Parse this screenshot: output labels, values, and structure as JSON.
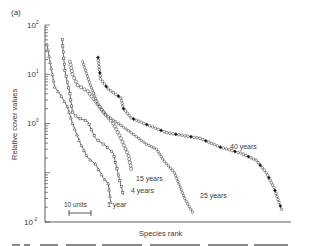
{
  "panel_label": "(a)",
  "chart_data": {
    "type": "line",
    "title": "",
    "xlabel": "Species rank",
    "ylabel": "Relative cover values",
    "yscale": "log",
    "ylim": [
      0.01,
      100
    ],
    "y_ticks": [
      {
        "label_base": "10",
        "label_exp": "2",
        "value": 100
      },
      {
        "label_base": "10",
        "label_exp": "1",
        "value": 10
      },
      {
        "label_base": "10",
        "label_exp": "0",
        "value": 1
      },
      {
        "label_base": "10",
        "label_exp": "-2",
        "value": 0.01
      }
    ],
    "scale_bar": {
      "label": "10 units",
      "length_units": 10
    },
    "grid": false,
    "legend": "inline labels at curve ends",
    "series": [
      {
        "name": "1 year",
        "marker": "triangle",
        "points": [
          [
            0,
            40
          ],
          [
            1,
            20
          ],
          [
            3,
            5.5
          ],
          [
            5,
            4
          ],
          [
            8,
            2.2
          ],
          [
            10,
            1.0
          ],
          [
            13,
            0.4
          ],
          [
            16,
            0.2
          ],
          [
            19,
            0.15
          ],
          [
            22,
            0.08
          ],
          [
            24,
            0.06
          ],
          [
            25,
            0.025
          ]
        ]
      },
      {
        "name": "4 years",
        "marker": "square",
        "points": [
          [
            6,
            50
          ],
          [
            7,
            12
          ],
          [
            9,
            4
          ],
          [
            10,
            1.7
          ],
          [
            12,
            1.3
          ],
          [
            16,
            1.1
          ],
          [
            19,
            0.5
          ],
          [
            23,
            0.35
          ],
          [
            26,
            0.25
          ],
          [
            28,
            0.09
          ],
          [
            30,
            0.035
          ]
        ]
      },
      {
        "name": "15 years",
        "marker": "circle-large",
        "points": [
          [
            9,
            18
          ],
          [
            10,
            10
          ],
          [
            12,
            6
          ],
          [
            16,
            4.5
          ],
          [
            19,
            2.8
          ],
          [
            23,
            1.5
          ],
          [
            26,
            1.0
          ],
          [
            29,
            0.5
          ],
          [
            32,
            0.22
          ],
          [
            33,
            0.12
          ]
        ]
      },
      {
        "name": "25 years",
        "marker": "circle-small",
        "points": [
          [
            14,
            18
          ],
          [
            17,
            6
          ],
          [
            20,
            2.5
          ],
          [
            23,
            1.5
          ],
          [
            28,
            1.0
          ],
          [
            33,
            0.65
          ],
          [
            39,
            0.38
          ],
          [
            43,
            0.3
          ],
          [
            46,
            0.17
          ],
          [
            50,
            0.1
          ],
          [
            54,
            0.03
          ],
          [
            57,
            0.016
          ]
        ]
      },
      {
        "name": "40 years",
        "marker": "circle-and-filled-diamond",
        "points": [
          [
            20,
            22
          ],
          [
            21,
            8
          ],
          [
            24,
            5
          ],
          [
            29,
            3.3
          ],
          [
            30,
            2.0
          ],
          [
            33,
            1.3
          ],
          [
            38,
            1.0
          ],
          [
            47,
            0.65
          ],
          [
            60,
            0.5
          ],
          [
            68,
            0.33
          ],
          [
            76,
            0.25
          ],
          [
            82,
            0.18
          ],
          [
            86,
            0.1
          ],
          [
            89,
            0.05
          ],
          [
            91,
            0.025
          ],
          [
            92,
            0.018
          ]
        ]
      }
    ]
  }
}
